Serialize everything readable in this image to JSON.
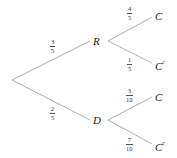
{
  "diagram": {
    "type": "probability-tree",
    "line_color": "#b0b0b0",
    "root": {
      "x": 12,
      "y": 80
    },
    "nodes": [
      {
        "id": "R",
        "label": "R",
        "sup": "",
        "x": 96,
        "y": 41
      },
      {
        "id": "D",
        "label": "D",
        "sup": "",
        "x": 96,
        "y": 120
      },
      {
        "id": "RC",
        "label": "C",
        "sup": "",
        "x": 158,
        "y": 16
      },
      {
        "id": "RCc",
        "label": "C",
        "sup": "c",
        "x": 158,
        "y": 63
      },
      {
        "id": "DC",
        "label": "C",
        "sup": "",
        "x": 158,
        "y": 97
      },
      {
        "id": "DCc",
        "label": "C",
        "sup": "c",
        "x": 158,
        "y": 144
      }
    ],
    "edges": [
      {
        "from": "root",
        "to": "R",
        "num": "3",
        "den": "5"
      },
      {
        "from": "root",
        "to": "D",
        "num": "2",
        "den": "5"
      },
      {
        "from": "R",
        "to": "RC",
        "num": "4",
        "den": "5"
      },
      {
        "from": "R",
        "to": "RCc",
        "num": "1",
        "den": "5"
      },
      {
        "from": "D",
        "to": "DC",
        "num": "3",
        "den": "10"
      },
      {
        "from": "D",
        "to": "DCc",
        "num": "7",
        "den": "10"
      }
    ]
  }
}
